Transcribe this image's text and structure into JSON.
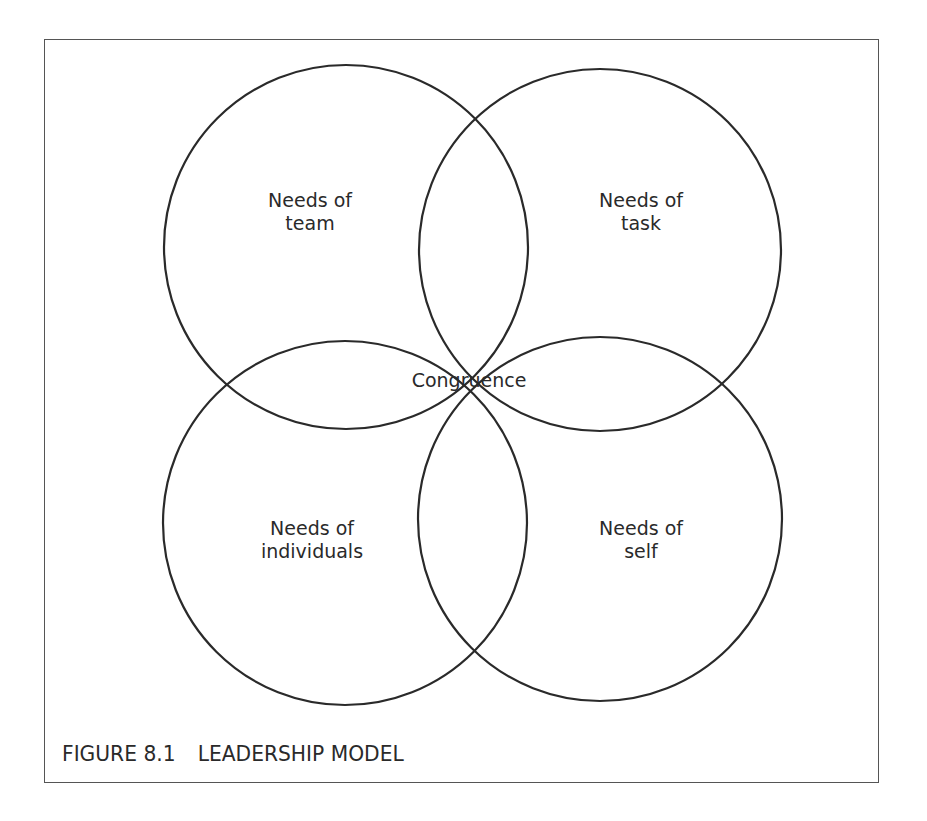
{
  "diagram": {
    "circles": [
      {
        "id": "team",
        "label_line1": "Needs of",
        "label_line2": "team"
      },
      {
        "id": "task",
        "label_line1": "Needs of",
        "label_line2": "task"
      },
      {
        "id": "individuals",
        "label_line1": "Needs of",
        "label_line2": "individuals"
      },
      {
        "id": "self",
        "label_line1": "Needs of",
        "label_line2": "self"
      }
    ],
    "center_label": "Congruence",
    "stroke_color": "#2a2a2a"
  },
  "caption": {
    "figure_number": "FIGURE 8.1",
    "title": "LEADERSHIP MODEL"
  }
}
